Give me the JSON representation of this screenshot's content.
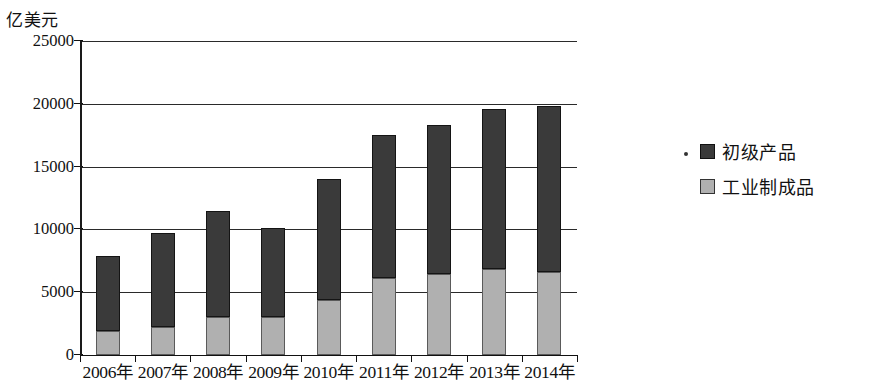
{
  "chart_data": {
    "type": "bar",
    "title": "",
    "subtitle": "",
    "stacked": true,
    "xlabel": "",
    "ylabel": "亿美元",
    "ylim": [
      0,
      25000
    ],
    "ytick_values": [
      0,
      5000,
      10000,
      15000,
      20000,
      25000
    ],
    "ytick_labels": [
      "0",
      "5000",
      "10000",
      "15000",
      "20000",
      "25000"
    ],
    "grid": true,
    "legend_position": "right",
    "categories": [
      "2006年",
      "2007年",
      "2008年",
      "2009年",
      "2010年",
      "2011年",
      "2012年",
      "2013年",
      "2014年"
    ],
    "series": [
      {
        "name": "工业制成品",
        "color": "#b0b0b0",
        "values": [
          1900,
          2200,
          3000,
          3000,
          4400,
          6100,
          6400,
          6800,
          6600
        ]
      },
      {
        "name": "初级产品",
        "color": "#3a3a3a",
        "values": [
          6000,
          7500,
          8500,
          7100,
          9600,
          11400,
          11900,
          12800,
          13200
        ]
      }
    ],
    "totals": [
      7900,
      9700,
      11500,
      10100,
      14000,
      17500,
      18300,
      19600,
      19800
    ]
  },
  "legend": {
    "bullet": "•",
    "entries": [
      {
        "label": "初级产品",
        "swatch": "primary"
      },
      {
        "label": "工业制成品",
        "swatch": "manufactured"
      }
    ]
  }
}
